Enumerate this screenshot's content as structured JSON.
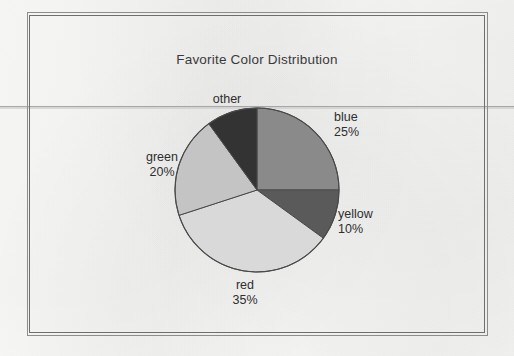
{
  "document": {
    "title": "Favorite Color Distribution",
    "background_color": "#f7f7f6",
    "frame_color": "#8d8d8d",
    "fold_line_color": "#9a9a9a"
  },
  "chart_data": {
    "type": "pie",
    "title": "Favorite Color Distribution",
    "xlabel": "",
    "ylabel": "",
    "legend_position": "none",
    "labels_outside": true,
    "start_angle_deg": 0,
    "direction": "clockwise",
    "categories": [
      "blue",
      "yellow",
      "red",
      "green",
      "other"
    ],
    "values": [
      25,
      20,
      35,
      10,
      10
    ],
    "slices": [
      {
        "name": "blue",
        "label": "blue",
        "percent_label": "25%",
        "value": 25,
        "fill": "#8a8a8a",
        "start_deg": 0,
        "end_deg": 90
      },
      {
        "name": "yellow",
        "label": "yellow",
        "percent_label": "10%",
        "value": 10,
        "fill": "#5a5a5a",
        "start_deg": 90,
        "end_deg": 126
      },
      {
        "name": "red",
        "label": "red",
        "percent_label": "35%",
        "value": 35,
        "fill": "#d9d9d9",
        "start_deg": 126,
        "end_deg": 252
      },
      {
        "name": "green",
        "label": "green",
        "percent_label": "20%",
        "value": 20,
        "fill": "#c4c4c4",
        "start_deg": 252,
        "end_deg": 324
      },
      {
        "name": "other",
        "label": "other",
        "percent_label": "",
        "value": 10,
        "fill": "#333333",
        "start_deg": 324,
        "end_deg": 360
      }
    ],
    "geometry": {
      "center_x": 257,
      "center_y": 190,
      "radius": 82,
      "outline_color": "#4a4a4a"
    }
  }
}
